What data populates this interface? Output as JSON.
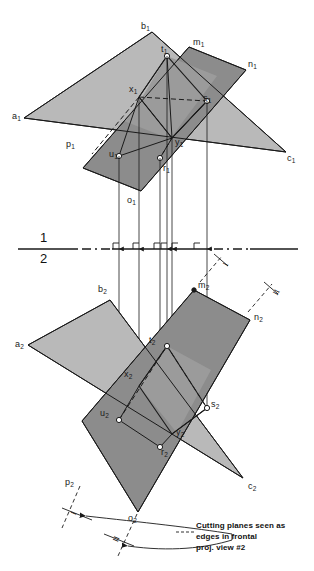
{
  "figure": {
    "title_partial": "",
    "caption": "Cutting planes seen as\nedges in frontal\nproj. view #2",
    "fold_line": {
      "upper": "1",
      "lower": "2"
    },
    "colors": {
      "triangle_fill": "#b9b9b9",
      "parallelogram_fill": "#8c8c8c",
      "overlap_fill": "#9c9c9c",
      "line": "#1a1a1a",
      "background": "#ffffff"
    }
  },
  "top_view": {
    "name": "top-view",
    "labels": [
      {
        "id": "a1",
        "base": "a",
        "sub": "1",
        "x": 12,
        "y": 112
      },
      {
        "id": "b1",
        "base": "b",
        "sub": "1",
        "x": 141,
        "y": 22
      },
      {
        "id": "c1",
        "base": "c",
        "sub": "1",
        "x": 287,
        "y": 154
      },
      {
        "id": "m1",
        "base": "m",
        "sub": "1",
        "x": 193,
        "y": 38
      },
      {
        "id": "n1",
        "base": "n",
        "sub": "1",
        "x": 248,
        "y": 60
      },
      {
        "id": "p1",
        "base": "p",
        "sub": "1",
        "x": 66,
        "y": 140
      },
      {
        "id": "o1",
        "base": "o",
        "sub": "1",
        "x": 127,
        "y": 196
      },
      {
        "id": "t1",
        "base": "t",
        "sub": "1",
        "x": 161,
        "y": 45
      },
      {
        "id": "s1",
        "base": "s",
        "sub": "1",
        "x": 203,
        "y": 94
      },
      {
        "id": "x1",
        "base": "x",
        "sub": "1",
        "x": 132,
        "y": 88
      },
      {
        "id": "y1",
        "base": "y",
        "sub": "1",
        "x": 177,
        "y": 140
      },
      {
        "id": "u1",
        "base": "u",
        "sub": "1",
        "x": 108,
        "y": 150
      },
      {
        "id": "r1",
        "base": "r",
        "sub": "1",
        "x": 164,
        "y": 166
      }
    ]
  },
  "front_view": {
    "name": "front-view",
    "labels": [
      {
        "id": "a2",
        "base": "a",
        "sub": "2",
        "x": 15,
        "y": 340
      },
      {
        "id": "b2",
        "base": "b",
        "sub": "2",
        "x": 98,
        "y": 285
      },
      {
        "id": "c2",
        "base": "c",
        "sub": "2",
        "x": 248,
        "y": 482
      },
      {
        "id": "m2",
        "base": "m",
        "sub": "2",
        "x": 198,
        "y": 282
      },
      {
        "id": "n2",
        "base": "n",
        "sub": "2",
        "x": 254,
        "y": 314
      },
      {
        "id": "p2",
        "base": "p",
        "sub": "2",
        "x": 65,
        "y": 478
      },
      {
        "id": "o2",
        "base": "o",
        "sub": "2",
        "x": 127,
        "y": 516
      },
      {
        "id": "t2",
        "base": "t",
        "sub": "2",
        "x": 147,
        "y": 337
      },
      {
        "id": "s2",
        "base": "s",
        "sub": "2",
        "x": 205,
        "y": 399
      },
      {
        "id": "x2",
        "base": "x",
        "sub": "2",
        "x": 126,
        "y": 371
      },
      {
        "id": "y2",
        "base": "y",
        "sub": "2",
        "x": 176,
        "y": 430
      },
      {
        "id": "u2",
        "base": "u",
        "sub": "2",
        "x": 100,
        "y": 409
      },
      {
        "id": "r2",
        "base": "r",
        "sub": "2",
        "x": 161,
        "y": 448
      }
    ]
  },
  "annotations": {
    "roman_numerals": [
      {
        "id": "rn-top-1",
        "text": "I",
        "x": 216,
        "y": 258
      },
      {
        "id": "rn-front-1",
        "text": "I",
        "x": 215,
        "y": 270
      },
      {
        "id": "rn-front-2",
        "text": "II",
        "x": 268,
        "y": 285
      },
      {
        "id": "rn-arc-1",
        "text": "I",
        "x": 72,
        "y": 516
      },
      {
        "id": "rn-arc-2",
        "text": "II",
        "x": 113,
        "y": 540
      }
    ]
  }
}
